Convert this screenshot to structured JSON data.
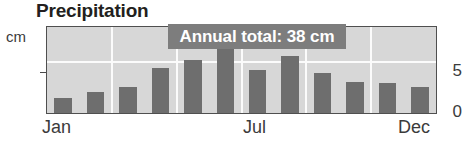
{
  "chart_data": {
    "type": "bar",
    "title": "Precipitation",
    "xlabel": "",
    "ylabel": "cm",
    "categories": [
      "Jan",
      "Feb",
      "Mar",
      "Apr",
      "May",
      "Jun",
      "Jul",
      "Aug",
      "Sep",
      "Oct",
      "Nov",
      "Dec"
    ],
    "values": [
      1.5,
      2.1,
      2.6,
      4.4,
      5.2,
      6.3,
      4.3,
      5.6,
      4.0,
      3.1,
      3.0,
      2.6
    ],
    "ylim": [
      0,
      8.5
    ],
    "yticks": [
      0,
      5
    ],
    "ytick_labels": [
      "0",
      "5"
    ],
    "xtick_labels_shown": [
      "Jan",
      "Jul",
      "Dec"
    ],
    "grid": "white vertical and horizontal gridlines on gray panel",
    "legend": "none",
    "annotations": [
      {
        "text": "Annual total: 38 cm",
        "style": "gray callout box with white bold text"
      }
    ],
    "bar_color": "#6e6e6e",
    "panel_color": "#d7d7d7",
    "callout_color": "#7d7d7d"
  },
  "title": "Precipitation",
  "axis": {
    "y_unit": "cm",
    "y_ticks": [
      {
        "label": "5"
      },
      {
        "label": "0"
      }
    ],
    "x_ticks": [
      {
        "label": "Jan"
      },
      {
        "label": "Jul"
      },
      {
        "label": "Dec"
      }
    ]
  },
  "callout": {
    "label": "Annual total: 38 cm"
  }
}
